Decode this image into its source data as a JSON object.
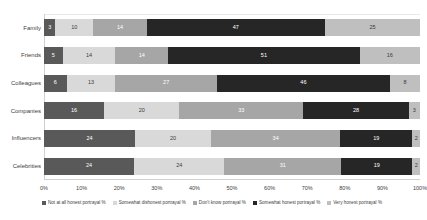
{
  "chart_data": {
    "type": "bar",
    "orientation": "horizontal",
    "stacked": true,
    "normalized_percent": true,
    "title": "",
    "xlabel": "",
    "ylabel": "",
    "xlim": [
      0,
      100
    ],
    "grid": false,
    "legend_position": "bottom",
    "categories": [
      "Family",
      "Friends",
      "Colleagues",
      "Companies",
      "Influencers",
      "Celebrities"
    ],
    "xticks": [
      "0%",
      "10%",
      "20%",
      "30%",
      "40%",
      "50%",
      "60%",
      "70%",
      "80%",
      "90%",
      "100%"
    ],
    "xtick_values": [
      0,
      10,
      20,
      30,
      40,
      50,
      60,
      70,
      80,
      90,
      100
    ],
    "series": [
      {
        "name": "Not at all honest portrayal %",
        "color": "#595959",
        "values": [
          3,
          5,
          6,
          16,
          24,
          24
        ]
      },
      {
        "name": "Somewhat dishonest portrayal %",
        "color": "#d9d9d9",
        "values": [
          10,
          14,
          13,
          20,
          20,
          24
        ]
      },
      {
        "name": "Don't know portrayal %",
        "color": "#a6a6a6",
        "values": [
          14,
          14,
          27,
          33,
          34,
          31
        ]
      },
      {
        "name": "Somewhat honest portrayal %",
        "color": "#262626",
        "values": [
          47,
          51,
          46,
          28,
          19,
          19
        ]
      },
      {
        "name": "Very honest portrayal %",
        "color": "#bfbfbf",
        "values": [
          25,
          16,
          8,
          3,
          2,
          2
        ]
      }
    ]
  }
}
